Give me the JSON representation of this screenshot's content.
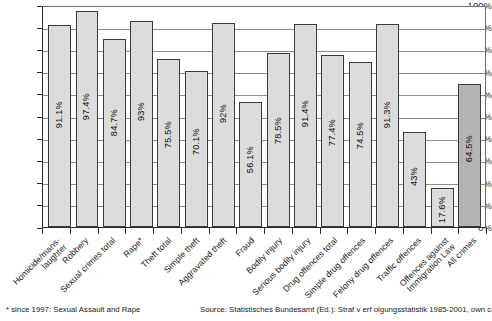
{
  "chart_data": {
    "type": "bar",
    "title": "",
    "xlabel": "",
    "ylabel": "",
    "ylim": [
      0,
      100
    ],
    "yticks": [
      "0%",
      "10%",
      "20%",
      "30%",
      "40%",
      "50%",
      "60%",
      "70%",
      "80%",
      "90%",
      "100%"
    ],
    "grid": true,
    "legend": "none",
    "categories": [
      "Homicide/mans-\nlaughter",
      "Robbery",
      "Sexual crimes total",
      "Rape*",
      "Theft total",
      "Simple theft",
      "Aggravated theft",
      "Fraud",
      "Bodily injury",
      "Serious bodily injury",
      "Drug offences total",
      "Simple drug offences",
      "Felony drug offences",
      "Traffic offences",
      "Offences against\nImmigration Law",
      "All crimes"
    ],
    "values": [
      91.1,
      97.4,
      84.7,
      93,
      75.5,
      70.1,
      92,
      56.1,
      78.5,
      91.4,
      77.4,
      74.5,
      91.3,
      43,
      17.6,
      64.5
    ],
    "value_labels": [
      "91.1%",
      "97.4%",
      "84.7%",
      "93%",
      "75.5%",
      "70.1%",
      "92%",
      "56.1%",
      "78.5%",
      "91.4%",
      "77.4%",
      "74.5%",
      "91.3%",
      "43%",
      "17.6%",
      "64.5%"
    ],
    "bar_styles": [
      "light",
      "light",
      "light",
      "light",
      "light",
      "light",
      "light",
      "light",
      "light",
      "light",
      "light",
      "light",
      "light",
      "light",
      "light",
      "dark"
    ],
    "colors": {
      "bar_light": "#dcdcdc",
      "bar_dark": "#b4b4b4",
      "bar_border": "#3a3a3a",
      "axis": "#2b2b2b",
      "grid": "#8d8d8d",
      "text": "#1a1a1a",
      "background": "#ffffff"
    }
  },
  "footer": {
    "footnote": "*  since 1997: Sexual Assault and Rape",
    "source": "Source: Statistisches Bundesamt (Ed.): Straf v erf olgungsstatistik 1985-2001, own calculations"
  }
}
